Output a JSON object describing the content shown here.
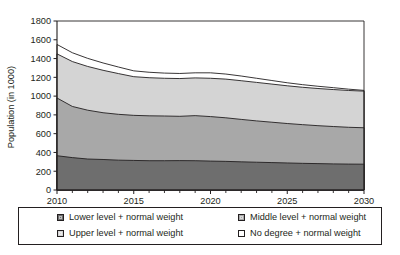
{
  "chart_data": {
    "type": "area",
    "stacked": true,
    "title": "",
    "subtitle": "",
    "xlabel": "",
    "ylabel": "Population (in 1000)",
    "xlim": [
      2010,
      2030
    ],
    "ylim": [
      0,
      1800
    ],
    "ytick_step": 200,
    "yticks": [
      0,
      200,
      400,
      600,
      800,
      1000,
      1200,
      1400,
      1600,
      1800
    ],
    "ytick_labels": [
      "0",
      "200",
      "400",
      "600",
      "800",
      "1000",
      "1200",
      "1400",
      "1600",
      "1800"
    ],
    "xticks": [
      2010,
      2015,
      2020,
      2025,
      2030
    ],
    "xtick_labels": [
      "2010",
      "2015",
      "2020",
      "2025",
      "2030"
    ],
    "x_minor_ticks_every": 1,
    "grid": false,
    "legend_position": "below-plot",
    "x": [
      2010,
      2011,
      2012,
      2013,
      2014,
      2015,
      2016,
      2017,
      2018,
      2019,
      2020,
      2021,
      2022,
      2023,
      2024,
      2025,
      2026,
      2027,
      2028,
      2029,
      2030
    ],
    "series": [
      {
        "name": "Lower level + normal weight",
        "color": "#6e6e6e",
        "values": [
          365,
          345,
          330,
          325,
          318,
          315,
          312,
          312,
          313,
          312,
          308,
          305,
          300,
          296,
          292,
          288,
          284,
          281,
          278,
          276,
          275
        ]
      },
      {
        "name": "Middle level + normal weight",
        "color": "#a8a8a8",
        "values": [
          615,
          545,
          520,
          498,
          488,
          480,
          478,
          476,
          472,
          480,
          474,
          464,
          452,
          440,
          430,
          420,
          412,
          404,
          398,
          392,
          388
        ]
      },
      {
        "name": "Upper level + normal weight",
        "color": "#d4d4d4",
        "values": [
          470,
          478,
          466,
          452,
          434,
          412,
          406,
          402,
          402,
          402,
          408,
          412,
          412,
          410,
          406,
          402,
          398,
          396,
          394,
          392,
          390
        ]
      },
      {
        "name": "No degree + normal weight",
        "color": "#ffffff",
        "values": [
          100,
          94,
          86,
          78,
          70,
          62,
          58,
          55,
          54,
          54,
          58,
          54,
          50,
          44,
          38,
          32,
          28,
          24,
          20,
          14,
          8
        ]
      }
    ],
    "cumulative_top_line": [
      1550,
      1462,
      1402,
      1353,
      1310,
      1269,
      1254,
      1245,
      1241,
      1248,
      1248,
      1235,
      1214,
      1190,
      1166,
      1142,
      1122,
      1105,
      1090,
      1074,
      1061
    ]
  },
  "legend": {
    "items": [
      {
        "label": "Lower level + normal weight",
        "color": "#6e6e6e"
      },
      {
        "label": "Middle level + normal weight",
        "color": "#a8a8a8"
      },
      {
        "label": "Upper level + normal weight",
        "color": "#d4d4d4"
      },
      {
        "label": "No degree + normal weight",
        "color": "#ffffff"
      }
    ]
  },
  "colors": {
    "axis": "#231f20",
    "background": "#ffffff",
    "series_line": "#231f20"
  }
}
